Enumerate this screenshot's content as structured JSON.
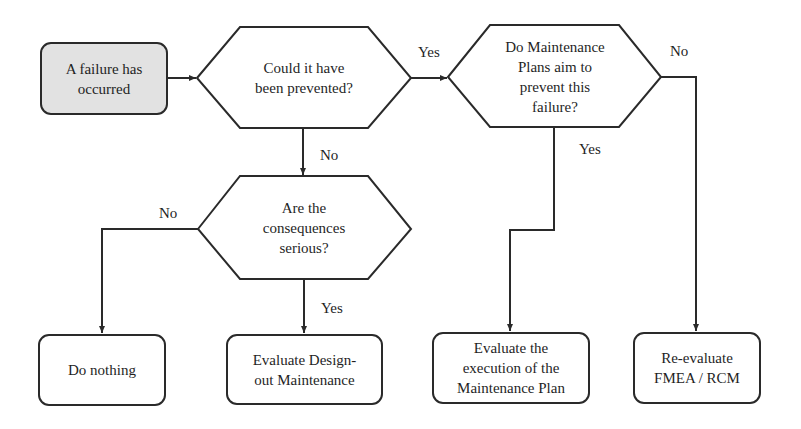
{
  "diagram": {
    "type": "flowchart",
    "colors": {
      "line": "#2a2a2a",
      "start_fill": "#e2e2e2",
      "node_fill": "#ffffff",
      "text": "#1f1f1f"
    },
    "nodes": {
      "start": {
        "shape": "rounded-rect",
        "text": "A failure has\noccurred"
      },
      "q_prevented": {
        "shape": "hexagon",
        "text": "Could it have\nbeen prevented?"
      },
      "q_plans": {
        "shape": "hexagon",
        "text": "Do Maintenance\nPlans aim to\nprevent this\nfailure?"
      },
      "q_consequences": {
        "shape": "hexagon",
        "text": "Are the\nconsequences\nserious?"
      },
      "do_nothing": {
        "shape": "rounded-rect",
        "text": "Do nothing"
      },
      "design_out": {
        "shape": "rounded-rect",
        "text": "Evaluate Design-\nout Maintenance"
      },
      "eval_execution": {
        "shape": "rounded-rect",
        "text": "Evaluate the\nexecution of the\nMaintenance Plan"
      },
      "reeval_fmea": {
        "shape": "rounded-rect",
        "text": "Re-evaluate\nFMEA / RCM"
      }
    },
    "edges": {
      "start_to_prevented": {
        "from": "start",
        "to": "q_prevented",
        "label": ""
      },
      "prevented_yes": {
        "from": "q_prevented",
        "to": "q_plans",
        "label": "Yes"
      },
      "prevented_no": {
        "from": "q_prevented",
        "to": "q_consequences",
        "label": "No"
      },
      "consequences_no": {
        "from": "q_consequences",
        "to": "do_nothing",
        "label": "No"
      },
      "consequences_yes": {
        "from": "q_consequences",
        "to": "design_out",
        "label": "Yes"
      },
      "plans_yes": {
        "from": "q_plans",
        "to": "eval_execution",
        "label": "Yes"
      },
      "plans_no": {
        "from": "q_plans",
        "to": "reeval_fmea",
        "label": "No"
      }
    }
  }
}
